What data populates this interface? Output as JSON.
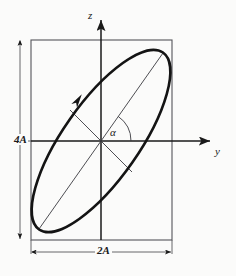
{
  "figure": {
    "kind": "polarization-ellipse-diagram",
    "background_color": "#fbfbfa",
    "ink_color": "#1a1a1a",
    "labels": {
      "vertical_axis": "z",
      "horizontal_axis": "y",
      "height_dimension": "4A",
      "width_dimension": "2A",
      "angle": "α"
    },
    "geometry": {
      "origin": {
        "x": 101,
        "y": 141
      },
      "bounding_box": {
        "left": 31,
        "top": 40,
        "right": 172,
        "bottom": 240,
        "width": 141,
        "height": 200
      },
      "ellipse": {
        "center_x": 101,
        "center_y": 141,
        "semi_major": 108,
        "semi_minor": 38,
        "rotation_deg": -55,
        "stroke_width": 2.6
      },
      "major_axis_endpoints": [
        {
          "x": 39,
          "y": 229
        },
        {
          "x": 163,
          "y": 53
        }
      ],
      "minor_axis_endpoints": [
        {
          "x": 70,
          "y": 110
        },
        {
          "x": 132,
          "y": 172
        }
      ],
      "z_axis": {
        "x": 101,
        "y_top": 18,
        "y_bottom": 240
      },
      "y_axis": {
        "y": 141,
        "x_left": 31,
        "x_right": 212
      },
      "height_dimension_line": {
        "x": 20,
        "y_top": 40,
        "y_bottom": 240
      },
      "width_dimension_line": {
        "y": 252,
        "x_left": 31,
        "x_right": 172
      },
      "direction_arrow_on_ellipse": {
        "x": 78,
        "y": 100,
        "heading_deg": -55
      },
      "angle_arc": {
        "radius": 30,
        "from_deg": 0,
        "to_deg": -55
      }
    }
  }
}
